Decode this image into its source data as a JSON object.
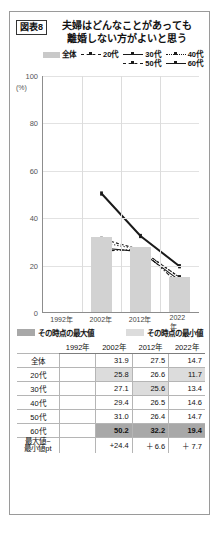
{
  "figure": {
    "tag": "図表8",
    "title_line1": "夫婦はどんなことがあっても",
    "title_line2": "離婚しない方がよいと思う"
  },
  "legend": {
    "items": [
      {
        "label": "全体",
        "style": "bar"
      },
      {
        "label": "20代",
        "style": "dashdot"
      },
      {
        "label": "30代",
        "style": "solid"
      },
      {
        "label": "40代",
        "style": "dot"
      },
      {
        "label": "50代",
        "style": "dash"
      },
      {
        "label": "60代",
        "style": "solid-thick"
      }
    ]
  },
  "axis": {
    "y_unit": "(%)",
    "y_ticks": [
      "100",
      "80",
      "60",
      "40",
      "20",
      "0"
    ],
    "x_ticks": [
      "1992年",
      "2002年",
      "2012年",
      "2022年"
    ]
  },
  "maxmin_key": {
    "max_label": "その時点の最大値",
    "min_label": "その時点の最小値"
  },
  "table": {
    "row_header_blank": "",
    "columns": [
      "1992年",
      "2002年",
      "2012年",
      "2022年"
    ],
    "rows": [
      {
        "label": "全体",
        "cells": [
          "",
          "31.9",
          "27.5",
          "14.7"
        ],
        "hl": [
          "",
          "",
          "",
          ""
        ]
      },
      {
        "label": "20代",
        "cells": [
          "",
          "25.8",
          "26.6",
          "11.7"
        ],
        "hl": [
          "",
          "min",
          "",
          "min"
        ]
      },
      {
        "label": "30代",
        "cells": [
          "",
          "27.1",
          "25.6",
          "13.4"
        ],
        "hl": [
          "",
          "",
          "min",
          ""
        ]
      },
      {
        "label": "40代",
        "cells": [
          "",
          "29.4",
          "26.5",
          "14.6"
        ],
        "hl": [
          "",
          "",
          "",
          ""
        ]
      },
      {
        "label": "50代",
        "cells": [
          "",
          "31.0",
          "26.4",
          "14.7"
        ],
        "hl": [
          "",
          "",
          "",
          ""
        ]
      },
      {
        "label": "60代",
        "cells": [
          "",
          "50.2",
          "32.2",
          "19.4"
        ],
        "hl": [
          "",
          "max",
          "max",
          "max"
        ]
      },
      {
        "label": "最大値−\n最小値pt",
        "cells": [
          "",
          "+24.4",
          "＋ 6.6",
          "＋ 7.7"
        ],
        "hl": [
          "",
          "",
          "",
          ""
        ]
      }
    ]
  },
  "chart_data": {
    "type": "line",
    "xlabel": "",
    "ylabel": "(%)",
    "ylim": [
      0,
      100
    ],
    "grid": true,
    "legend_position": "top-right",
    "categories": [
      "1992年",
      "2002年",
      "2012年",
      "2022年"
    ],
    "bars": {
      "name": "全体",
      "values": [
        null,
        31.9,
        27.5,
        14.7
      ]
    },
    "series": [
      {
        "name": "20代",
        "values": [
          null,
          25.8,
          26.6,
          11.7
        ]
      },
      {
        "name": "30代",
        "values": [
          null,
          27.1,
          25.6,
          13.4
        ]
      },
      {
        "name": "40代",
        "values": [
          null,
          29.4,
          26.5,
          14.6
        ]
      },
      {
        "name": "50代",
        "values": [
          null,
          31.0,
          26.4,
          14.7
        ]
      },
      {
        "name": "60代",
        "values": [
          null,
          50.2,
          32.2,
          19.4
        ]
      }
    ],
    "annotations": [
      "最大値−最小値pt: +24.4 / ＋6.6 / ＋7.7"
    ]
  }
}
